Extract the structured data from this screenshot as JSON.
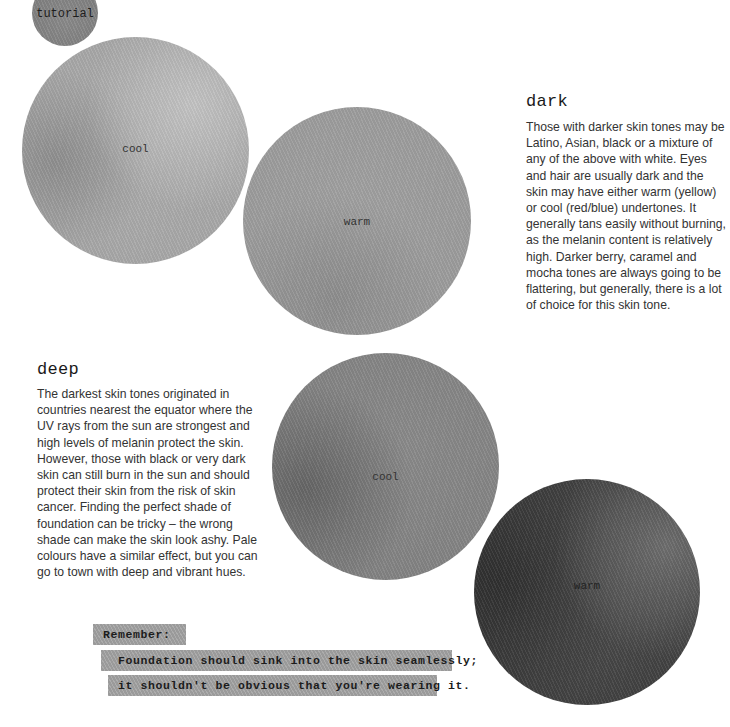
{
  "badge": {
    "label": "tutorial"
  },
  "swatches": {
    "light_cool": {
      "label": "cool",
      "color": "#aaaaaa"
    },
    "light_warm": {
      "label": "warm",
      "color": "#9c9c9c"
    },
    "deep_cool": {
      "label": "cool",
      "color": "#838383"
    },
    "deep_warm": {
      "label": "warm",
      "color": "#454545"
    }
  },
  "sections": {
    "dark": {
      "heading": "dark",
      "body": "Those with darker skin tones may be Latino, Asian, black or a mixture of any of the above with white. Eyes and hair are usually dark and the skin may have either warm (yellow) or cool (red/blue) undertones. It generally tans easily without burning, as the melanin content is relatively high. Darker berry, caramel and mocha tones are always going to be flattering, but generally, there is a lot of choice for this skin tone."
    },
    "deep": {
      "heading": "deep",
      "body": "The darkest skin tones originated in countries nearest the equator where the UV rays from the sun are strongest and high levels of melanin protect the skin. However, those with black or very dark skin can still burn in the sun and should protect their skin from the risk of skin cancer. Finding the perfect shade of foundation can be tricky – the wrong shade can make the skin look ashy. Pale colours have a similar effect, but you can go to town with deep and vibrant hues."
    }
  },
  "callout": {
    "title": "Remember:",
    "line_1": "Foundation should sink into the skin seamlessly;",
    "line_2": "it shouldn't be obvious that you're wearing it."
  }
}
